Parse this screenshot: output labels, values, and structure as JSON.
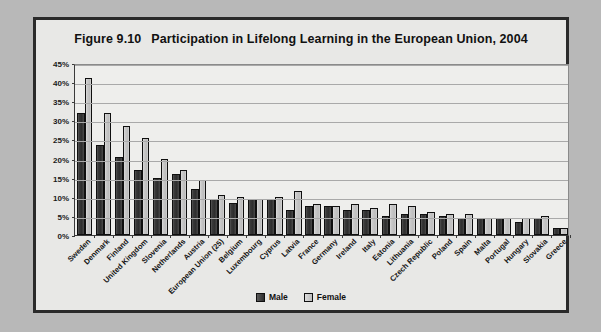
{
  "figure": {
    "number": "Figure 9.10",
    "title": "Participation in Lifelong Learning in the European Union, 2004"
  },
  "legend": {
    "male_label": "Male",
    "female_label": "Female",
    "male_color": "#2e2e2e",
    "female_color": "#c9c9c9"
  },
  "axis": {
    "y_ticks": [
      "0%",
      "5%",
      "10%",
      "15%",
      "20%",
      "25%",
      "30%",
      "35%",
      "40%",
      "45%"
    ]
  },
  "chart_data": {
    "type": "bar",
    "xlabel": "",
    "ylabel": "",
    "ylim": [
      0,
      45
    ],
    "ytick_step": 5,
    "grid": true,
    "legend_position": "bottom-center",
    "categories": [
      "Sweden",
      "Denmark",
      "Finland",
      "United Kingdom",
      "Slovenia",
      "Netherlands",
      "Austria",
      "European Union (25)",
      "Belgium",
      "Luxembourg",
      "Cyprus",
      "Latvia",
      "France",
      "Germany",
      "Ireland",
      "Italy",
      "Estonia",
      "Lithuania",
      "Czech Republic",
      "Poland",
      "Spain",
      "Malta",
      "Portugal",
      "Hungary",
      "Slovakia",
      "Greece"
    ],
    "series": [
      {
        "name": "Male",
        "color": "#2e2e2e",
        "values": [
          32.0,
          23.5,
          20.5,
          17.0,
          15.0,
          16.0,
          12.0,
          9.5,
          8.5,
          9.5,
          9.5,
          6.5,
          7.5,
          7.5,
          6.5,
          6.5,
          5.0,
          5.5,
          5.5,
          5.0,
          4.5,
          4.5,
          4.5,
          3.5,
          4.5,
          1.8
        ]
      },
      {
        "name": "Female",
        "color": "#c9c9c9",
        "values": [
          41.0,
          32.0,
          28.5,
          25.5,
          20.0,
          17.0,
          14.5,
          10.5,
          10.0,
          9.5,
          10.0,
          11.5,
          8.0,
          7.5,
          8.0,
          7.0,
          8.0,
          7.5,
          6.0,
          5.5,
          5.5,
          4.5,
          4.5,
          4.5,
          5.0,
          1.8
        ]
      }
    ]
  }
}
